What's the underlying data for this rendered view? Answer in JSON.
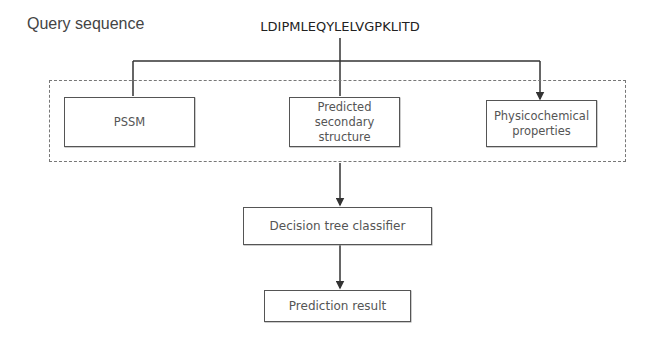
{
  "diagram": {
    "title": "Query sequence",
    "sequence": "LDIPMLEQYLELVGPKLITD",
    "feature_group": {
      "style": "dashed",
      "boxes": [
        {
          "id": "pssm",
          "label": "PSSM"
        },
        {
          "id": "secondary",
          "label": "Predicted\nsecondary\nstructure"
        },
        {
          "id": "physchem",
          "label": "Physicochemical\nproperties"
        }
      ]
    },
    "classifier": {
      "label": "Decision tree classifier"
    },
    "result": {
      "label": "Prediction result"
    },
    "edges": [
      {
        "from": "sequence",
        "to": "pssm"
      },
      {
        "from": "sequence",
        "to": "secondary"
      },
      {
        "from": "sequence",
        "to": "physchem"
      },
      {
        "from": "feature_group",
        "to": "classifier"
      },
      {
        "from": "classifier",
        "to": "result"
      }
    ],
    "colors": {
      "line": "#333333",
      "box_border": "#555555",
      "dashed_border": "#777777",
      "text": "#555555"
    }
  }
}
